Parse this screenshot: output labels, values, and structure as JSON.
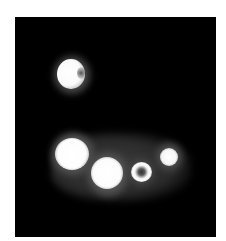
{
  "image": {
    "description": "Grayscale fluorescence micrograph of bright cell-like blobs on a black background",
    "background_color": "#000000",
    "border_color": "#ffffff"
  },
  "blobs": [
    {
      "name": "isolated-cell-top",
      "cx": 55,
      "cy": 57,
      "r": 14
    },
    {
      "name": "cell-left-large",
      "cx": 55,
      "cy": 136,
      "r": 16
    },
    {
      "name": "cell-center-large",
      "cx": 92,
      "cy": 154,
      "r": 16
    },
    {
      "name": "cell-ring",
      "cx": 127,
      "cy": 155,
      "r": 11
    },
    {
      "name": "cell-right-small",
      "cx": 153,
      "cy": 139,
      "r": 10
    }
  ]
}
